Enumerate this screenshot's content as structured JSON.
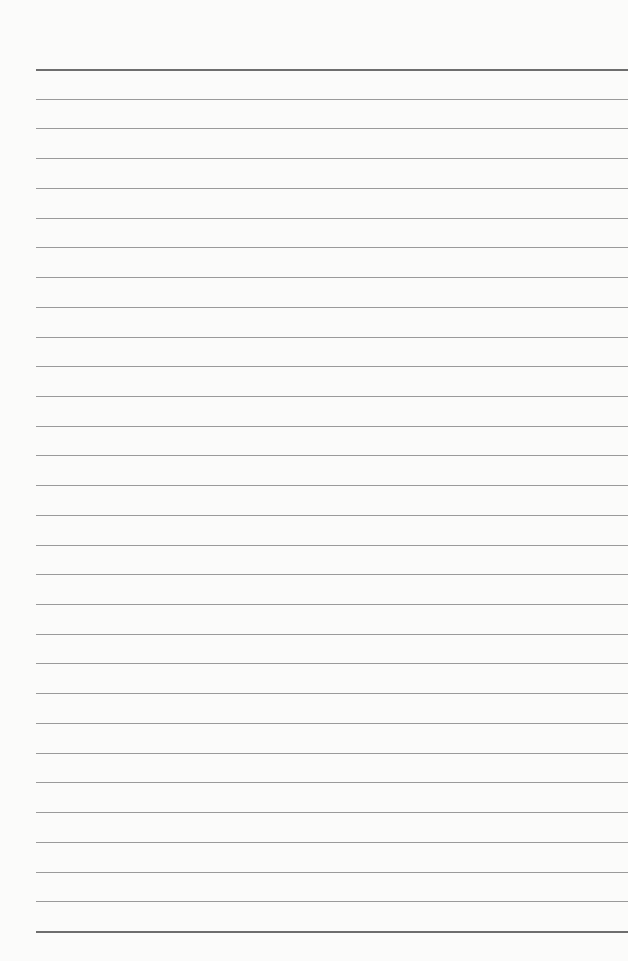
{
  "page": {
    "type": "lined-paper",
    "line_count": 30,
    "line_color": "#9a9a9a",
    "top_line_color": "#6e6e6e",
    "background_color": "#fbfbfa"
  }
}
